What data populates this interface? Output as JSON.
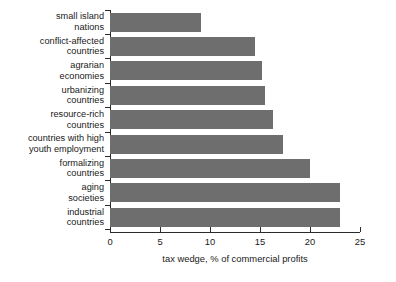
{
  "chart_data": {
    "type": "bar",
    "orientation": "horizontal",
    "title": "",
    "subtitle": "",
    "xlabel": "tax wedge, % of commercial profits",
    "ylabel": "",
    "xlim": [
      0,
      25
    ],
    "xticks": [
      0,
      5,
      10,
      15,
      20,
      25
    ],
    "xtick_labels": [
      "0",
      "5",
      "10",
      "15",
      "20",
      "25"
    ],
    "grid": false,
    "legend": null,
    "bar_color": "#6e6e6e",
    "axis_color": "#2b2b2b",
    "background_color": "#ffffff",
    "categories": [
      "small island nations",
      "conflict-affected countries",
      "agrarian economies",
      "urbanizing countries",
      "resource-rich countries",
      "countries with high youth employment",
      "formalizing countries",
      "aging societies",
      "industrial countries"
    ],
    "category_lines": [
      [
        "small island",
        "nations"
      ],
      [
        "conflict-affected",
        "countries"
      ],
      [
        "agrarian",
        "economies"
      ],
      [
        "urbanizing",
        "countries"
      ],
      [
        "resource-rich",
        "countries"
      ],
      [
        "countries with high",
        "youth employment"
      ],
      [
        "formalizing",
        "countries"
      ],
      [
        "aging",
        "societies"
      ],
      [
        "industrial",
        "countries"
      ]
    ],
    "values": [
      9.1,
      14.5,
      15.2,
      15.5,
      16.3,
      17.3,
      20.0,
      23.0,
      23.0
    ]
  }
}
